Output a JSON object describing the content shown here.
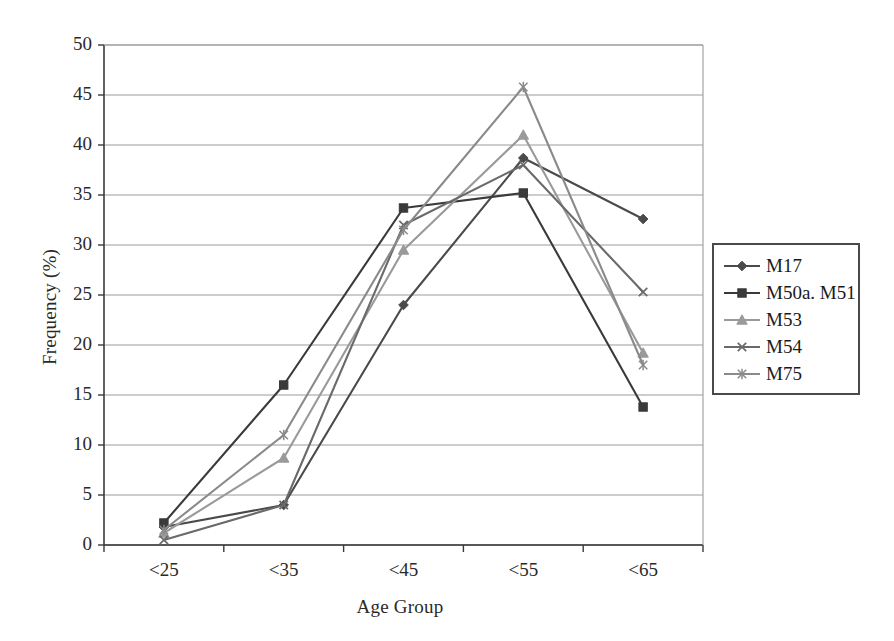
{
  "chart_data": {
    "type": "line",
    "title": "",
    "xlabel": "Age Group",
    "ylabel": "Frequency (%)",
    "categories": [
      "<25",
      "<35",
      "<45",
      "<55",
      "<65"
    ],
    "ylim": [
      0,
      50
    ],
    "yticks": [
      0,
      5,
      10,
      15,
      20,
      25,
      30,
      35,
      40,
      45,
      50
    ],
    "ytick_labels": [
      "0",
      "5",
      "10",
      "15",
      "20",
      "25",
      "30",
      "35",
      "40",
      "45",
      "50"
    ],
    "grid": "horizontal",
    "legend_position": "right",
    "series": [
      {
        "name": "M17",
        "marker": "diamond",
        "color": "#4a4a4a",
        "values": [
          1.8,
          4.0,
          24.0,
          38.7,
          32.6
        ]
      },
      {
        "name": "M50a. M51",
        "marker": "square",
        "color": "#3a3a3a",
        "values": [
          2.2,
          16.0,
          33.7,
          35.2,
          13.8
        ]
      },
      {
        "name": "M53",
        "marker": "triangle",
        "color": "#9a9a9a",
        "values": [
          1.2,
          8.7,
          29.5,
          41.0,
          19.2
        ]
      },
      {
        "name": "M54",
        "marker": "x",
        "color": "#6a6a6a",
        "values": [
          0.5,
          4.0,
          32.0,
          38.0,
          25.3
        ]
      },
      {
        "name": "M75",
        "marker": "asterisk",
        "color": "#8a8a8a",
        "values": [
          1.5,
          11.0,
          31.5,
          45.8,
          18.0
        ]
      }
    ]
  },
  "axes": {
    "ylabel": "Frequency (%)",
    "xlabel": "Age Group"
  },
  "legend": {
    "items": [
      {
        "label": "M17"
      },
      {
        "label": "M50a. M51"
      },
      {
        "label": "M53"
      },
      {
        "label": "M54"
      },
      {
        "label": "M75"
      }
    ]
  }
}
